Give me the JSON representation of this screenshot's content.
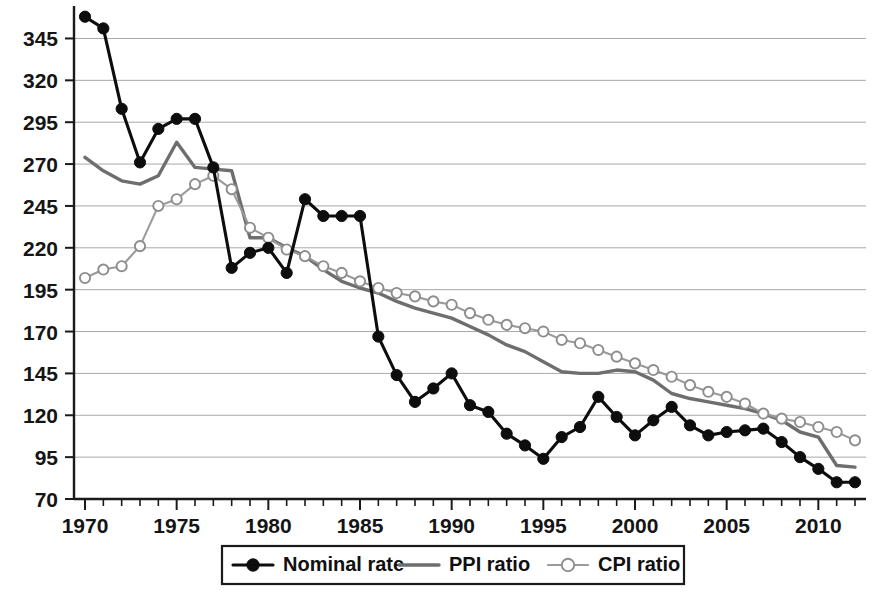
{
  "chart_data": {
    "type": "line",
    "title": "",
    "subtitle": "",
    "xlabel": "",
    "ylabel": "",
    "xlim": [
      1969.4,
      2012.6
    ],
    "ylim": [
      70,
      362
    ],
    "ytick_labels": [
      "345",
      "320",
      "295",
      "270",
      "245",
      "220",
      "195",
      "170",
      "145",
      "120",
      "95",
      "70"
    ],
    "ytick_values": [
      345,
      320,
      295,
      270,
      245,
      220,
      195,
      170,
      145,
      120,
      95,
      70
    ],
    "xtick_labels": [
      "1970",
      "1975",
      "1980",
      "1985",
      "1990",
      "1995",
      "2000",
      "2005",
      "2010"
    ],
    "xtick_values": [
      1970,
      1975,
      1980,
      1985,
      1990,
      1995,
      2000,
      2005,
      2010
    ],
    "x_minor_step": 1,
    "grid": true,
    "grid_axis": "y",
    "legend_position": "bottom-center",
    "x": [
      1970,
      1971,
      1972,
      1973,
      1974,
      1975,
      1976,
      1977,
      1978,
      1979,
      1980,
      1981,
      1982,
      1983,
      1984,
      1985,
      1986,
      1987,
      1988,
      1989,
      1990,
      1991,
      1992,
      1993,
      1994,
      1995,
      1996,
      1997,
      1998,
      1999,
      2000,
      2001,
      2002,
      2003,
      2004,
      2005,
      2006,
      2007,
      2008,
      2009,
      2010,
      2011,
      2012
    ],
    "series": [
      {
        "name": "Nominal rate",
        "color": "#0d0d0d",
        "marker": "filled-circle",
        "values": [
          358,
          351,
          303,
          271,
          291,
          297,
          297,
          268,
          208,
          217,
          220,
          205,
          249,
          239,
          239,
          239,
          167,
          144,
          128,
          136,
          145,
          126,
          122,
          109,
          102,
          94,
          107,
          113,
          131,
          119,
          108,
          117,
          125,
          114,
          108,
          110,
          111,
          112,
          104,
          95,
          88,
          80,
          80
        ],
        "legend_icon": "line-with-filled-marker"
      },
      {
        "name": "PPI ratio",
        "color": "#6e6e6e",
        "marker": "none",
        "values": [
          274,
          266,
          260,
          258,
          263,
          283,
          268,
          267,
          266,
          226,
          226,
          220,
          215,
          207,
          200,
          196,
          193,
          188,
          184,
          181,
          178,
          173,
          168,
          162,
          158,
          152,
          146,
          145,
          145,
          147,
          146,
          141,
          133,
          130,
          128,
          126,
          124,
          121,
          117,
          110,
          107,
          90,
          89
        ],
        "legend_icon": "plain-line"
      },
      {
        "name": "CPI ratio",
        "color": "#9a9a9a",
        "marker": "open-circle",
        "values": [
          202,
          207,
          209,
          221,
          245,
          249,
          258,
          263,
          255,
          232,
          226,
          219,
          215,
          209,
          205,
          200,
          196,
          193,
          191,
          188,
          186,
          181,
          177,
          174,
          172,
          170,
          165,
          163,
          159,
          155,
          151,
          147,
          143,
          138,
          134,
          131,
          127,
          121,
          118,
          116,
          113,
          110,
          105
        ],
        "legend_icon": "line-with-open-marker"
      }
    ],
    "legend_entries": [
      "Nominal rate",
      "PPI ratio",
      "CPI ratio"
    ]
  },
  "colors": {
    "background": "#ffffff",
    "gridline": "#a8a8a8",
    "axis": "#1a1a1a",
    "nominal": "#0d0d0d",
    "ppi": "#6e6e6e",
    "cpi": "#9a9a9a"
  }
}
